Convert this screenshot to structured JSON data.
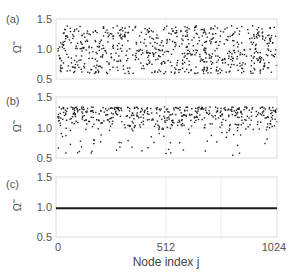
{
  "chart_data": [
    {
      "type": "scatter",
      "panel_label": "(a)",
      "ylabel": "Ω̃",
      "ylim": [
        0.5,
        1.5
      ],
      "yticks": [
        "0.5",
        "1.0",
        "1.5"
      ],
      "xlim": [
        0,
        1024
      ],
      "description": "Dense random scatter of node frequencies spread roughly uniformly between ~0.6 and ~1.4",
      "y_range_of_points": [
        0.6,
        1.4
      ],
      "n_points": 1024
    },
    {
      "type": "scatter",
      "panel_label": "(b)",
      "ylabel": "Ω̃",
      "ylim": [
        0.5,
        1.5
      ],
      "yticks": [
        "0.5",
        "1.0",
        "1.5"
      ],
      "xlim": [
        0,
        1024
      ],
      "description": "Scatter concentrated between ~0.95 and ~1.35 with sparse outliers down to ~0.55",
      "y_range_of_points": [
        0.55,
        1.35
      ],
      "dense_band": [
        0.95,
        1.35
      ],
      "n_points": 1024
    },
    {
      "type": "line",
      "panel_label": "(c)",
      "ylabel": "Ω̃",
      "ylim": [
        0.5,
        1.5
      ],
      "yticks": [
        "0.5",
        "1.0",
        "1.5"
      ],
      "xlim": [
        0,
        1024
      ],
      "description": "All nodes synchronized at constant frequency",
      "x": [
        0,
        1024
      ],
      "values": [
        0.98,
        0.98
      ]
    }
  ],
  "x_axis": {
    "label": "Node index j",
    "ticks": [
      "0",
      "512",
      "1024"
    ]
  },
  "panels": [
    {
      "label": "(a)",
      "ylabel": "Ω̃",
      "yticks": [
        "1.5",
        "1.0",
        "0.5"
      ]
    },
    {
      "label": "(b)",
      "ylabel": "Ω̃",
      "yticks": [
        "1.5",
        "1.0",
        "0.5"
      ]
    },
    {
      "label": "(c)",
      "ylabel": "Ω̃",
      "yticks": [
        "1.5",
        "1.0",
        "0.5"
      ]
    }
  ],
  "colors": {
    "points": "#222222",
    "line": "#1a1a1a",
    "frame": "#dcdcdc",
    "text": "#555555"
  }
}
